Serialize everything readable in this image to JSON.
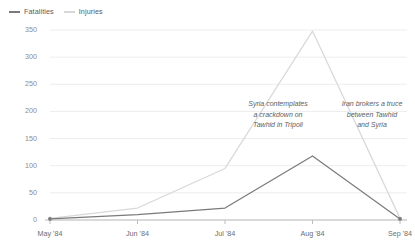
{
  "legend": {
    "position": "top-left",
    "items": [
      {
        "label": "Fatalities",
        "color": "#7a7a7a",
        "key": "fatalities"
      },
      {
        "label": "Injuries",
        "color": "#d8d8d8",
        "key": "injuries"
      }
    ]
  },
  "colors": {
    "background": "#ffffff",
    "grid": "#ededed",
    "axis": "#bdbdbd",
    "fatalities": "#7a7a7a",
    "injuries": "#d8d8d8",
    "tick_text": "#8c8c8c",
    "annotation_text": "#5e5e5e"
  },
  "chart_data": {
    "type": "line",
    "title": "",
    "subtitle": "",
    "xlabel": "",
    "ylabel": "",
    "categories": [
      "May '84",
      "Jun '84",
      "Jul '84",
      "Aug '84",
      "Sep '84"
    ],
    "x": [
      "May '84",
      "Jun '84",
      "Jul '84",
      "Aug '84",
      "Sep '84"
    ],
    "series": [
      {
        "name": "Fatalities",
        "color": "#7a7a7a",
        "values": [
          2,
          10,
          22,
          118,
          2
        ]
      },
      {
        "name": "Injuries",
        "color": "#d8d8d8",
        "values": [
          3,
          22,
          95,
          348,
          3
        ]
      }
    ],
    "ylim": [
      0,
      350
    ],
    "yticks": [
      0,
      50,
      100,
      150,
      200,
      250,
      300,
      350
    ],
    "ytick_labels": [
      "0",
      "50",
      "100",
      "150",
      "200",
      "250",
      "300",
      "350"
    ],
    "grid": true,
    "grid_axis": "y",
    "legend_position": "top-left",
    "markers": true,
    "annotations": [
      {
        "text": "Syria contemplates\na crackdown on\nTawhid in Tripoli",
        "near_x": "Jul '84",
        "align": "center",
        "style": "italic"
      },
      {
        "text": "Iran brokers a truce\nbetween Tawhid\nand Syria",
        "near_x": "Aug '84",
        "align": "center",
        "style": "italic"
      }
    ]
  }
}
